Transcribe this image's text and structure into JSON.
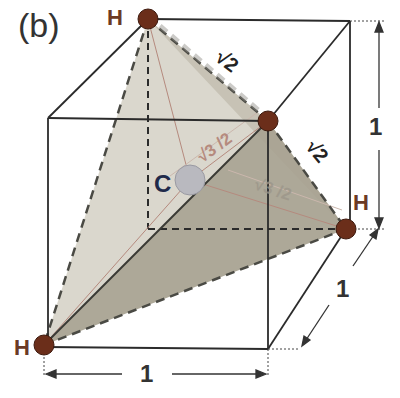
{
  "panel_label": "(b)",
  "atoms": {
    "hydrogen_label": "H",
    "carbon_label": "C",
    "hydrogen_color": "#6b2e1a",
    "carbon_color": "#b9b9bf"
  },
  "edge_labels": {
    "hh_top": "√2",
    "hh_right": "√2",
    "ch_top": "√3 /2",
    "ch_right": "√3 /2"
  },
  "dimensions": {
    "width": "1",
    "height": "1",
    "depth": "1"
  },
  "colors": {
    "face_light": "#d6d3c8",
    "face_dark": "#a8a291",
    "line": "#2b2b2b",
    "dim_label": "#333333",
    "h_label": "#6b3a25",
    "c_label": "#1f2a4a",
    "ch_label": "#b58a7e"
  }
}
